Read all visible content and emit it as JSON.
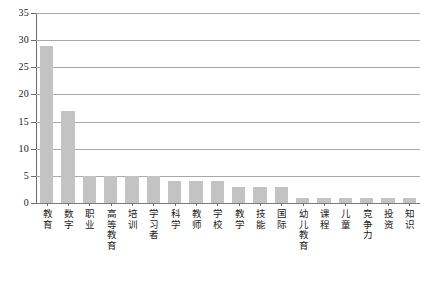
{
  "chart_data": {
    "type": "bar",
    "title": "",
    "subtitle": "",
    "xlabel": "",
    "ylabel": "",
    "ylim": [
      0,
      35
    ],
    "yticks": [
      0,
      5,
      10,
      15,
      20,
      25,
      30,
      35
    ],
    "ytick_labels": [
      "0",
      "5",
      "10",
      "15",
      "20",
      "25",
      "30",
      "35"
    ],
    "grid": true,
    "legend": false,
    "legend_position": "none",
    "bar_color": "#c3c3c3",
    "categories": [
      "教育",
      "数字",
      "职业",
      "高等教育",
      "培训",
      "学习者",
      "科学",
      "教师",
      "学校",
      "教学",
      "技能",
      "国际",
      "幼儿教育",
      "课程",
      "儿童",
      "竞争力",
      "投资",
      "知识"
    ],
    "values": [
      29,
      17,
      5,
      5,
      5,
      5,
      4,
      4,
      4,
      3,
      3,
      3,
      1,
      1,
      1,
      1,
      1,
      1
    ]
  }
}
